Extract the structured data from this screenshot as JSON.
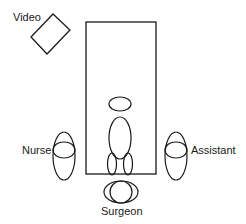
{
  "diagram": {
    "type": "operating-room-layout",
    "labels": {
      "video": "Video",
      "nurse": "Nurse",
      "assistant": "Assistant",
      "surgeon": "Surgeon"
    },
    "stroke_color": "#1a1a1a",
    "background": "#ffffff"
  }
}
